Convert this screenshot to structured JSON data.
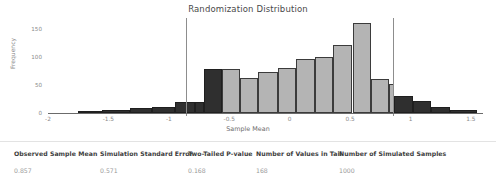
{
  "chart_data": {
    "type": "bar",
    "title": "Randomization Distribution",
    "xlabel": "Sample Mean",
    "ylabel": "Frequency",
    "xlim": [
      -2.0,
      1.6
    ],
    "ylim": [
      0,
      170
    ],
    "xticks": [
      "-2",
      "-1.5",
      "-1",
      "-0.5",
      "0",
      "0.5",
      "1",
      "1.5"
    ],
    "xtick_values": [
      -2,
      -1.5,
      -1,
      -0.5,
      0,
      0.5,
      1,
      1.5
    ],
    "yticks": [
      "0",
      "50",
      "100",
      "150"
    ],
    "ytick_values": [
      0,
      50,
      100,
      150
    ],
    "grid": false,
    "legend": "none",
    "bin_width": 0.25,
    "categories": [
      "-1.75",
      "-1.50",
      "-1.25",
      "-1.00",
      "-0.75",
      "-0.50",
      "-0.25",
      "0.00",
      "0.25",
      "0.50",
      "0.75",
      "1.00",
      "1.25",
      "1.50",
      "1.75",
      "2.00",
      "2.25",
      "2.50",
      "2.75",
      "3.00"
    ],
    "bins": [
      {
        "left": -1.75,
        "right": -1.55,
        "value": 3,
        "tail": true
      },
      {
        "left": -1.55,
        "right": -1.32,
        "value": 5,
        "tail": true
      },
      {
        "left": -1.32,
        "right": -1.14,
        "value": 9,
        "tail": true
      },
      {
        "left": -1.14,
        "right": -0.95,
        "value": 10,
        "tail": true
      },
      {
        "left": -0.95,
        "right": -0.78,
        "value": 19,
        "tail": true
      },
      {
        "left": -0.78,
        "right": -0.71,
        "value": 19,
        "tail": true
      },
      {
        "left": -0.71,
        "right": -0.56,
        "value": 78,
        "tail": true
      },
      {
        "left": -0.56,
        "right": -0.41,
        "value": 78,
        "tail": false
      },
      {
        "left": -0.41,
        "right": -0.26,
        "value": 62,
        "tail": false
      },
      {
        "left": -0.26,
        "right": -0.1,
        "value": 73,
        "tail": false
      },
      {
        "left": -0.1,
        "right": 0.05,
        "value": 80,
        "tail": false
      },
      {
        "left": 0.05,
        "right": 0.21,
        "value": 96,
        "tail": false
      },
      {
        "left": 0.21,
        "right": 0.36,
        "value": 101,
        "tail": false
      },
      {
        "left": 0.36,
        "right": 0.52,
        "value": 122,
        "tail": false
      },
      {
        "left": 0.52,
        "right": 0.67,
        "value": 161,
        "tail": false
      },
      {
        "left": 0.67,
        "right": 0.82,
        "value": 60,
        "tail": false
      },
      {
        "left": 0.82,
        "right": 0.86,
        "value": 52,
        "tail": false
      },
      {
        "left": 0.86,
        "right": 1.02,
        "value": 30,
        "tail": true
      },
      {
        "left": 1.02,
        "right": 1.17,
        "value": 22,
        "tail": true
      },
      {
        "left": 1.17,
        "right": 1.33,
        "value": 10,
        "tail": true
      },
      {
        "left": 1.33,
        "right": 1.55,
        "value": 6,
        "tail": true
      }
    ],
    "reference_lines": [
      {
        "name": "lower-tail-cutoff",
        "value": -0.857
      },
      {
        "name": "observed-sample-mean",
        "value": 0.857
      }
    ],
    "colors": {
      "bar_fill": "#b4b4b4",
      "bar_tail_fill": "#2f2f2f",
      "bar_edge": "#3b3b3b",
      "reference_line": "#8d8d8d",
      "axis": "#6b6b6b",
      "text": "#555555"
    }
  },
  "summary": {
    "columns": [
      {
        "header": "Observed Sample Mean",
        "value": "0.857"
      },
      {
        "header": "Simulation Standard Error",
        "value": "0.571"
      },
      {
        "header": "Two-Tailed P-value",
        "value": "0.168"
      },
      {
        "header": "Number of Values in Tail",
        "value": "168"
      },
      {
        "header": "Number of Simulated Samples",
        "value": "1000"
      }
    ]
  }
}
